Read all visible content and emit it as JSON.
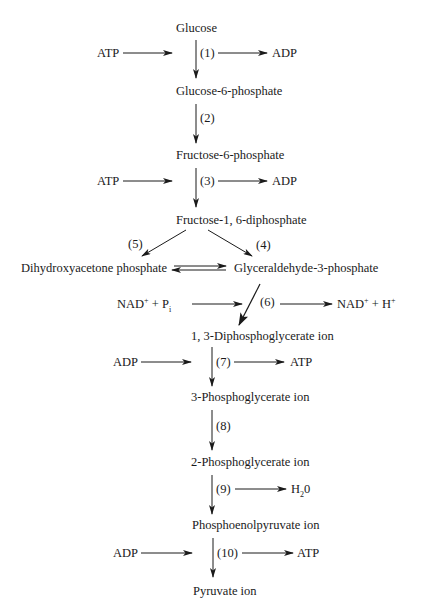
{
  "diagram": {
    "compounds": {
      "glucose": "Glucose",
      "glucose_6_phosphate": "Glucose-6-phosphate",
      "fructose_6_phosphate": "Fructose-6-phosphate",
      "fructose_1_6_diphosphate": "Fructose-1, 6-diphosphate",
      "dihydroxyacetone_phosphate": "Dihydroxyacetone phosphate",
      "glyceraldehyde_3_phosphate": "Glyceraldehyde-3-phosphate",
      "diphosphoglycerate_1_3": "1, 3-Diphosphoglycerate ion",
      "phosphoglycerate_3": "3-Phosphoglycerate ion",
      "phosphoglycerate_2": "2-Phosphoglycerate ion",
      "phosphoenolpyruvate": "Phosphoenolpyruvate ion",
      "pyruvate": "Pyruvate ion"
    },
    "steps": [
      {
        "id": "1",
        "label": "(1)",
        "input": "ATP",
        "output": "ADP"
      },
      {
        "id": "2",
        "label": "(2)"
      },
      {
        "id": "3",
        "label": "(3)",
        "input": "ATP",
        "output": "ADP"
      },
      {
        "id": "4",
        "label": "(4)"
      },
      {
        "id": "5",
        "label": "(5)"
      },
      {
        "id": "6",
        "label": "(6)",
        "input_main": "NAD",
        "input_sup": "+",
        "input_plus": " + P",
        "input_sub": "i",
        "output_main": "NAD",
        "output_sup": "+",
        "output_plus": " + H",
        "output_sup2": "+"
      },
      {
        "id": "7",
        "label": "(7)",
        "input": "ADP",
        "output": "ATP"
      },
      {
        "id": "8",
        "label": "(8)"
      },
      {
        "id": "9",
        "label": "(9)",
        "output_main": "H",
        "output_sub": "2",
        "output_tail": "0"
      },
      {
        "id": "10",
        "label": "(10)",
        "input": "ADP",
        "output": "ATP"
      }
    ],
    "colors": {
      "line": "#1a1a1a",
      "background": "#ffffff"
    }
  }
}
